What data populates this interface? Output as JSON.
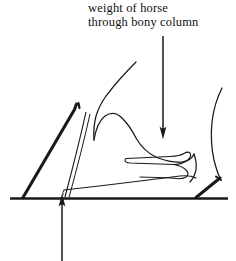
{
  "figure": {
    "background_color": "#ffffff",
    "ink_color": "#1a1a1a",
    "width": 236,
    "height": 261
  },
  "caption": {
    "line1": "weight of horse",
    "line2": "through bony column"
  },
  "annotations": {
    "load_arrow": {
      "name": "downward-load-arrow",
      "direction": "down",
      "shaft_x": 163,
      "shaft_top_y": 36,
      "tip_y": 139,
      "meaning": "weight of horse through bony column"
    },
    "ground_reaction_arrow": {
      "name": "upward-ground-reaction-arrow",
      "direction": "up",
      "shaft_x": 62,
      "shaft_bottom_y": 261,
      "tip_y": 193,
      "meaning": "ground reaction force at toe"
    }
  },
  "structures": [
    {
      "id": "ground-line",
      "label": "ground line"
    },
    {
      "id": "toe-wall",
      "label": "hoof wall at toe"
    },
    {
      "id": "heel-wall",
      "label": "hoof wall at heel"
    },
    {
      "id": "pastern-front",
      "label": "front of pastern"
    },
    {
      "id": "pastern-rear",
      "label": "rear of pastern"
    },
    {
      "id": "coronet",
      "label": "coronet band"
    },
    {
      "id": "coffin-bone",
      "label": "coffin bone"
    },
    {
      "id": "sole-line",
      "label": "sole"
    }
  ]
}
